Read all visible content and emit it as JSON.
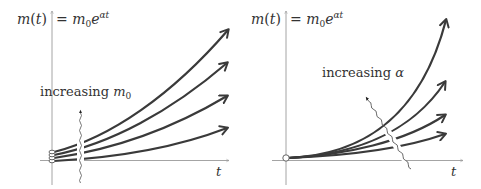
{
  "panels": [
    {
      "id": "left",
      "y_label": "m(t)",
      "equation_lhs": "= m",
      "equation_sub": "0",
      "equation_base": "e",
      "equation_exp": "αt",
      "x_label": "t",
      "annotation_text": "increasing ",
      "annotation_symbol": "m",
      "annotation_sub": "0",
      "description": "Exponential curves with different initial values m0, same growth rate alpha",
      "curve_count": 4
    },
    {
      "id": "right",
      "y_label": "m(t)",
      "equation_lhs": "= m",
      "equation_sub": "0",
      "equation_base": "e",
      "equation_exp": "αt",
      "x_label": "t",
      "annotation_text": "increasing ",
      "annotation_symbol": "α",
      "description": "Exponential curves with same initial value m0, different growth rates alpha",
      "curve_count": 4
    }
  ],
  "colors": {
    "curve": "#3a3a3a",
    "axis": "#9a9a9a",
    "text": "#333333",
    "background": "#ffffff"
  }
}
